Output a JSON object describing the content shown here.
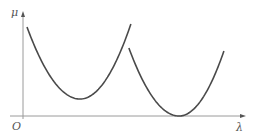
{
  "chart_data": {
    "type": "line",
    "title": "",
    "xlabel": "λ",
    "ylabel": "μ",
    "origin_label": "O",
    "xlim": [
      0,
      100
    ],
    "ylim": [
      0,
      100
    ],
    "grid": false,
    "ticks": false,
    "series": [
      {
        "name": "curve-1",
        "shape": "parabola",
        "start": [
          1.8,
          85.6
        ],
        "vertex": [
          25.7,
          16.3
        ],
        "end": [
          48.6,
          88.5
        ]
      },
      {
        "name": "curve-2",
        "shape": "parabola",
        "start": [
          47.7,
          65.4
        ],
        "vertex": [
          70.3,
          0
        ],
        "end": [
          90.5,
          62.5
        ]
      }
    ],
    "colors": {
      "curve": "#4a4a4a",
      "axis": "#9a9a9a"
    }
  }
}
